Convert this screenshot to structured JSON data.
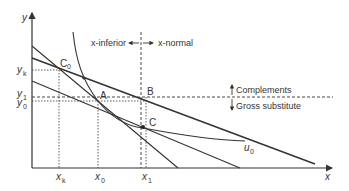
{
  "diagram": {
    "axes": {
      "x_label": "x",
      "y_label": "y"
    },
    "y_ticks": [
      {
        "label": "y",
        "sub": "k",
        "y": 70
      },
      {
        "label": "y",
        "sub": "1",
        "y": 95
      },
      {
        "label": "y",
        "sub": "0",
        "y": 104
      }
    ],
    "x_ticks": [
      {
        "label": "x",
        "sub": "k",
        "x": 59
      },
      {
        "label": "x",
        "sub": "0",
        "x": 98
      },
      {
        "label": "x",
        "sub": "1",
        "x": 145
      }
    ],
    "points": {
      "C0": {
        "label": "C",
        "sub": "0"
      },
      "A": {
        "label": "A"
      },
      "B": {
        "label": "B"
      },
      "C": {
        "label": "C"
      }
    },
    "curve_label": {
      "label": "u",
      "sub": "0"
    },
    "annotations": {
      "x_inferior": "x-inferior",
      "x_normal": "x-normal",
      "complements": "Complements",
      "gross_substitute": "Gross substitute"
    },
    "colors": {
      "line": "#333333",
      "dashed": "#333333"
    }
  }
}
